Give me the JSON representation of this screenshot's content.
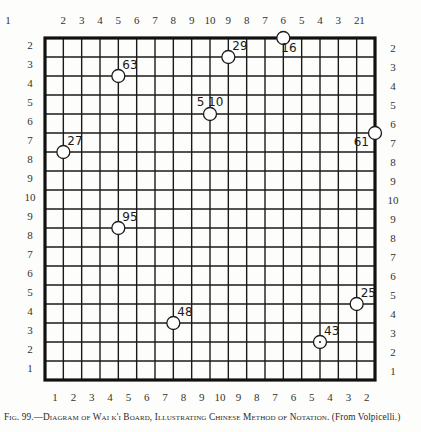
{
  "figure": {
    "caption_prefix": "Fig. 99.—",
    "caption_main": "Diagram of Wai k'i Board, Illustrating Chinese Method of Notation.",
    "caption_source": "(From Volpicelli.)"
  },
  "board": {
    "grid_lines": 19,
    "line_color": "#1a1a1a",
    "border_color": "#111111",
    "stone_fill": "#ffffff",
    "stone_stroke": "#1a1a1a"
  },
  "labels": {
    "top": [
      "1",
      "2",
      "3",
      "4",
      "5",
      "6",
      "7",
      "8",
      "9",
      "10",
      "9",
      "8",
      "7",
      "6",
      "5",
      "4",
      "3",
      "2",
      "1"
    ],
    "bottom": [
      "1",
      "2",
      "3",
      "4",
      "5",
      "6",
      "7",
      "8",
      "9",
      "10",
      "9",
      "8",
      "7",
      "6",
      "5",
      "4",
      "3",
      "2",
      "1"
    ],
    "left": [
      "2",
      "3",
      "4",
      "5",
      "6",
      "7",
      "8",
      "9",
      "10",
      "9",
      "8",
      "7",
      "6",
      "5",
      "4",
      "3",
      "2",
      "1"
    ],
    "right": [
      "2",
      "3",
      "4",
      "5",
      "6",
      "7",
      "8",
      "9",
      "10",
      "9",
      "8",
      "7",
      "6",
      "5",
      "4",
      "3",
      "2",
      "1"
    ]
  },
  "stones": [
    {
      "label": "16",
      "col": 13,
      "row": 0,
      "label_pos": "below-right"
    },
    {
      "label": "29",
      "col": 10,
      "row": 1,
      "label_pos": "above-right"
    },
    {
      "label": "63",
      "col": 4,
      "row": 2,
      "label_pos": "above-right"
    },
    {
      "label": "5 10",
      "col": 9,
      "row": 4,
      "label_pos": "above"
    },
    {
      "label": "27",
      "col": 1,
      "row": 6,
      "label_pos": "above-right"
    },
    {
      "label": "61",
      "col": 18,
      "row": 5,
      "label_pos": "below-left"
    },
    {
      "label": "95",
      "col": 4,
      "row": 10,
      "label_pos": "above-right"
    },
    {
      "label": "48",
      "col": 7,
      "row": 15,
      "label_pos": "above-right"
    },
    {
      "label": "25",
      "col": 17,
      "row": 14,
      "label_pos": "above-right"
    },
    {
      "label": "43",
      "col": 15,
      "row": 16,
      "label_pos": "above-right",
      "dot": true
    }
  ]
}
